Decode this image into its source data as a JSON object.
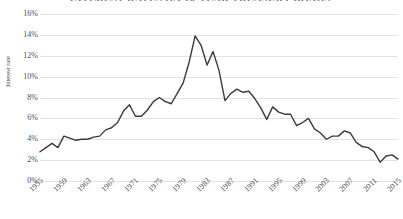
{
  "chart_data": {
    "type": "line",
    "title": "INTEREST RATES ON 10-YEAR TREASURY BONDS",
    "xlabel": "",
    "ylabel": "Interest rate",
    "ylim": [
      0,
      16
    ],
    "ytick_values": [
      16,
      14,
      12,
      10,
      8,
      6,
      4,
      2,
      0
    ],
    "ytick_labels": [
      "16%",
      "14%",
      "12%",
      "10%",
      "8%",
      "6%",
      "4%",
      "2%",
      "0%"
    ],
    "xlim": [
      1955,
      2015
    ],
    "xtick_labels": [
      "1955",
      "1959",
      "1963",
      "1967",
      "1971",
      "1975",
      "1979",
      "1983",
      "1987",
      "1991",
      "1995",
      "1999",
      "2003",
      "2007",
      "2011",
      "2015"
    ],
    "xtick_values": [
      1955,
      1959,
      1963,
      1967,
      1971,
      1975,
      1979,
      1983,
      1987,
      1991,
      1995,
      1999,
      2003,
      2007,
      2011,
      2015
    ],
    "grid": "horizontal",
    "legend": "none",
    "line_color": "#3b3b3b",
    "grid_color": "#e2e2e4",
    "series": [
      {
        "name": "10-year Treasury bond interest rate",
        "x": [
          1955,
          1956,
          1957,
          1958,
          1959,
          1960,
          1961,
          1962,
          1963,
          1964,
          1965,
          1966,
          1967,
          1968,
          1969,
          1970,
          1971,
          1972,
          1973,
          1974,
          1975,
          1976,
          1977,
          1978,
          1979,
          1980,
          1981,
          1982,
          1983,
          1984,
          1985,
          1986,
          1987,
          1988,
          1989,
          1990,
          1991,
          1992,
          1993,
          1994,
          1995,
          1996,
          1997,
          1998,
          1999,
          2000,
          2001,
          2002,
          2003,
          2004,
          2005,
          2006,
          2007,
          2008,
          2009,
          2010,
          2011,
          2012,
          2013,
          2014,
          2015
        ],
        "values": [
          2.8,
          3.2,
          3.6,
          3.2,
          4.3,
          4.1,
          3.9,
          4.0,
          4.0,
          4.2,
          4.3,
          4.9,
          5.1,
          5.6,
          6.7,
          7.3,
          6.2,
          6.2,
          6.8,
          7.6,
          8.0,
          7.6,
          7.4,
          8.4,
          9.4,
          11.4,
          13.9,
          13.0,
          11.1,
          12.4,
          10.6,
          7.7,
          8.4,
          8.8,
          8.5,
          8.6,
          7.9,
          7.0,
          5.9,
          7.1,
          6.6,
          6.4,
          6.4,
          5.3,
          5.6,
          6.0,
          5.0,
          4.6,
          4.0,
          4.3,
          4.3,
          4.8,
          4.6,
          3.7,
          3.3,
          3.2,
          2.8,
          1.8,
          2.4,
          2.5,
          2.1
        ]
      }
    ]
  }
}
